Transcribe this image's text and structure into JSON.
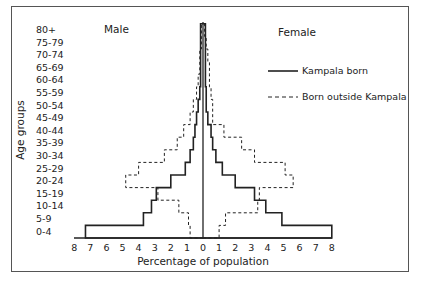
{
  "chart_data": {
    "type": "population-pyramid",
    "title": "",
    "xlabel": "Percentage of population",
    "ylabel": "Age groups",
    "side_labels": {
      "left": "Male",
      "right": "Female"
    },
    "x_ticks_left": [
      "8",
      "7",
      "6",
      "5",
      "4",
      "3",
      "2",
      "1",
      "0"
    ],
    "x_ticks_right": [
      "1",
      "2",
      "3",
      "4",
      "5",
      "6",
      "7",
      "8"
    ],
    "xlim": [
      -8,
      8
    ],
    "grid": false,
    "legend_position": "upper right",
    "categories": [
      "0-4",
      "5-9",
      "10-14",
      "15-19",
      "20-24",
      "25-29",
      "30-34",
      "35-39",
      "40-44",
      "45-49",
      "50-54",
      "55-59",
      "60-64",
      "65-69",
      "70-74",
      "75-79",
      "80+"
    ],
    "series": [
      {
        "name": "Kampala born",
        "sex": "Male",
        "style": "solid",
        "values": [
          7.3,
          3.7,
          3.2,
          2.9,
          2.0,
          1.1,
          0.8,
          0.6,
          0.5,
          0.4,
          0.3,
          0.2,
          0.15,
          0.15,
          0.15,
          0.15,
          0.15
        ]
      },
      {
        "name": "Born outside Kampala",
        "sex": "Male",
        "style": "dashed",
        "values": [
          0.8,
          0.9,
          1.5,
          2.8,
          4.8,
          4.0,
          2.4,
          1.6,
          1.2,
          0.8,
          0.6,
          0.4,
          0.3,
          0.2,
          0.2,
          0.1,
          0.1
        ]
      },
      {
        "name": "Kampala born",
        "sex": "Female",
        "style": "solid",
        "values": [
          8.0,
          4.9,
          3.9,
          3.2,
          2.0,
          1.2,
          0.8,
          0.6,
          0.5,
          0.3,
          0.2,
          0.2,
          0.15,
          0.15,
          0.15,
          0.15,
          0.15
        ]
      },
      {
        "name": "Born outside Kampala",
        "sex": "Female",
        "style": "dashed",
        "values": [
          1.0,
          1.4,
          3.4,
          3.5,
          5.6,
          5.1,
          3.2,
          2.4,
          1.3,
          0.6,
          0.6,
          0.5,
          0.4,
          0.4,
          0.3,
          0.2,
          0.1
        ]
      }
    ]
  },
  "legend": {
    "items": [
      {
        "label": "Kampala born",
        "style": "solid"
      },
      {
        "label": "Born outside Kampala",
        "style": "dashed"
      }
    ]
  },
  "labels": {
    "male": "Male",
    "female": "Female",
    "xlabel": "Percentage of population",
    "ylabel": "Age groups"
  },
  "colors": {
    "line": "#222222",
    "frame": "#555555",
    "background": "#ffffff"
  }
}
